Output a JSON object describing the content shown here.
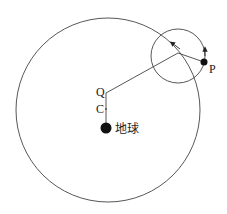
{
  "diagram": {
    "type": "geocentric-epicycle-model",
    "labels": {
      "Q": "Q",
      "C": "C",
      "P": "P",
      "earth": "地球"
    },
    "colors": {
      "stroke": "#444444",
      "fill": "#111111",
      "background": "#ffffff"
    },
    "elements": [
      {
        "name": "deferent",
        "shape": "circle",
        "center": [
          108,
          110
        ],
        "radius": 92
      },
      {
        "name": "epicycle",
        "shape": "circle",
        "center": [
          178,
          56
        ],
        "radius": 27
      },
      {
        "name": "earth",
        "shape": "dot",
        "center": [
          106,
          128
        ],
        "radius": 5
      },
      {
        "name": "equant-Q",
        "shape": "point",
        "center": [
          106,
          91
        ]
      },
      {
        "name": "center-C",
        "shape": "point",
        "center": [
          106,
          109
        ]
      },
      {
        "name": "planet-P",
        "shape": "dot",
        "center": [
          204,
          62
        ],
        "radius": 3.5
      }
    ]
  }
}
